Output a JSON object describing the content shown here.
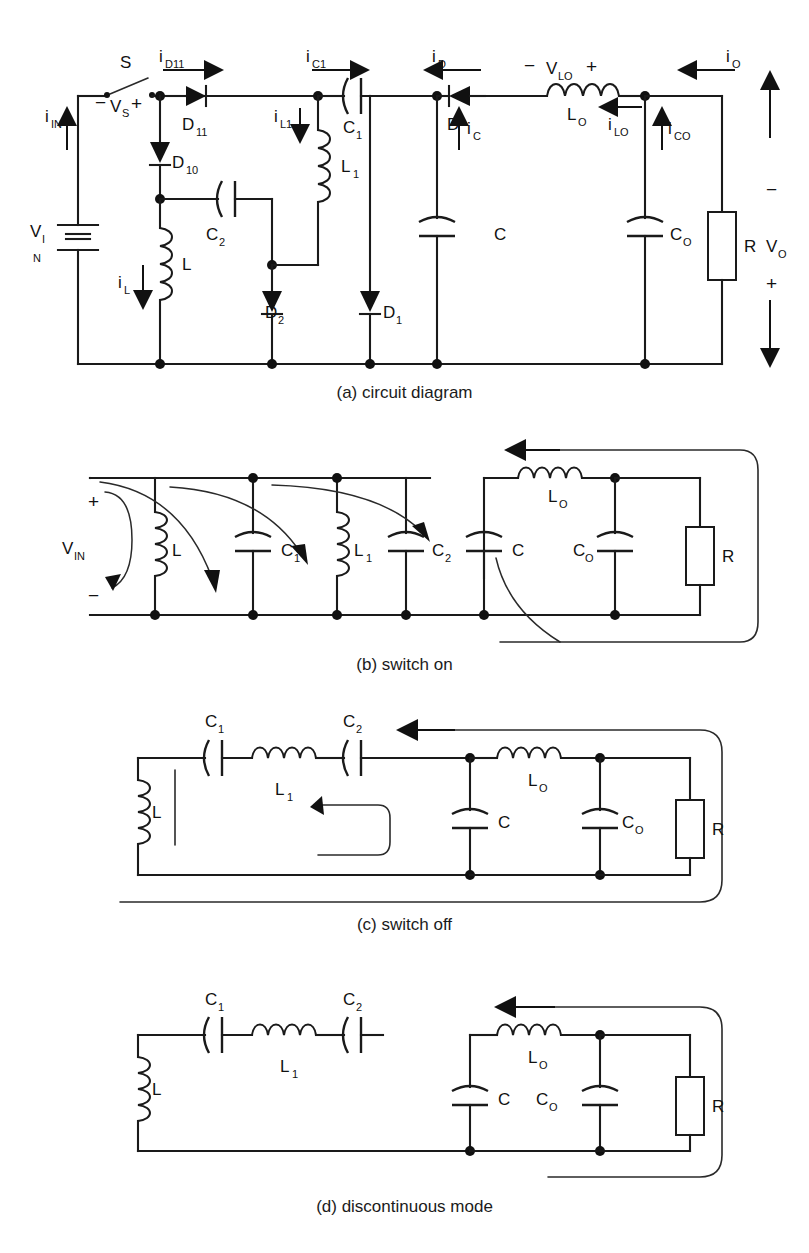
{
  "figure": {
    "panels": [
      {
        "id": "a",
        "caption": "(a) circuit diagram",
        "components": [
          {
            "name": "S",
            "type": "switch"
          },
          {
            "name": "V S",
            "type": "voltage-label"
          },
          {
            "name": "V IN",
            "type": "source"
          },
          {
            "name": "D 11",
            "type": "diode"
          },
          {
            "name": "D 10",
            "type": "diode"
          },
          {
            "name": "D 2",
            "type": "diode"
          },
          {
            "name": "D 1",
            "type": "diode"
          },
          {
            "name": "D",
            "type": "diode"
          },
          {
            "name": "L",
            "type": "inductor"
          },
          {
            "name": "L 1",
            "type": "inductor"
          },
          {
            "name": "L O",
            "type": "inductor"
          },
          {
            "name": "C 1",
            "type": "capacitor"
          },
          {
            "name": "C 2",
            "type": "capacitor"
          },
          {
            "name": "C",
            "type": "capacitor"
          },
          {
            "name": "C O",
            "type": "capacitor"
          },
          {
            "name": "R",
            "type": "resistor"
          },
          {
            "name": "V O",
            "type": "output-voltage"
          }
        ],
        "currents": [
          "i IN",
          "i D11",
          "i C1",
          "i D",
          "i O",
          "i L1",
          "i L",
          "i C",
          "i LO",
          "i CO"
        ],
        "voltages": [
          "V S",
          "V LO",
          "V IN",
          "V O"
        ],
        "labels": {
          "switch": "S",
          "vs": "V",
          "vs_sub": "S",
          "vin_main": "V",
          "vin_sub1": "I",
          "vin_sub2": "N",
          "i_in": "i",
          "i_in_sub": "IN",
          "i_d11": "i",
          "i_d11_sub": "D11",
          "d11": "D",
          "d11_sub": "11",
          "d10": "D",
          "d10_sub": "10",
          "d2": "D",
          "d2_sub": "2",
          "d1": "D",
          "d1_sub": "1",
          "d": "D",
          "i_l": "i",
          "i_l_sub": "L",
          "l": "L",
          "c2": "C",
          "c2_sub": "2",
          "i_l1": "i",
          "i_l1_sub": "L1",
          "l1": "L",
          "l1_sub": "1",
          "i_c1": "i",
          "i_c1_sub": "C1",
          "c1": "C",
          "c1_sub": "1",
          "i_d": "i",
          "i_d_sub": "D",
          "i_c": "i",
          "i_c_sub": "C",
          "v_lo": "V",
          "v_lo_sub": "LO",
          "lo": "L",
          "lo_sub": "O",
          "i_lo": "i",
          "i_lo_sub": "LO",
          "i_co": "i",
          "i_co_sub": "CO",
          "c": "C",
          "co": "C",
          "co_sub": "O",
          "r": "R",
          "vo": "V",
          "vo_sub": "O",
          "i_o": "i",
          "i_o_sub": "O",
          "plus": "+",
          "minus": "−"
        }
      },
      {
        "id": "b",
        "caption": "(b) switch on",
        "components": [
          {
            "name": "V IN",
            "type": "source"
          },
          {
            "name": "L",
            "type": "inductor"
          },
          {
            "name": "C 1",
            "type": "capacitor"
          },
          {
            "name": "L 1",
            "type": "inductor"
          },
          {
            "name": "C 2",
            "type": "capacitor"
          },
          {
            "name": "C",
            "type": "capacitor"
          },
          {
            "name": "L O",
            "type": "inductor"
          },
          {
            "name": "C O",
            "type": "capacitor"
          },
          {
            "name": "R",
            "type": "resistor"
          }
        ],
        "labels": {
          "vin": "V",
          "vin_sub": "IN",
          "l": "L",
          "c1": "C",
          "c1_sub": "1",
          "l1": "L",
          "l1_sub": "1",
          "c2": "C",
          "c2_sub": "2",
          "c": "C",
          "lo": "L",
          "lo_sub": "O",
          "co": "C",
          "co_sub": "O",
          "r": "R",
          "plus": "+",
          "minus": "−"
        }
      },
      {
        "id": "c",
        "caption": "(c) switch off",
        "components": [
          {
            "name": "L",
            "type": "inductor"
          },
          {
            "name": "C 1",
            "type": "capacitor"
          },
          {
            "name": "L 1",
            "type": "inductor"
          },
          {
            "name": "C 2",
            "type": "capacitor"
          },
          {
            "name": "C",
            "type": "capacitor"
          },
          {
            "name": "L O",
            "type": "inductor"
          },
          {
            "name": "C O",
            "type": "capacitor"
          },
          {
            "name": "R",
            "type": "resistor"
          }
        ],
        "labels": {
          "l": "L",
          "c1": "C",
          "c1_sub": "1",
          "l1": "L",
          "l1_sub": "1",
          "c2": "C",
          "c2_sub": "2",
          "c": "C",
          "lo": "L",
          "lo_sub": "O",
          "co": "C",
          "co_sub": "O",
          "r": "R"
        }
      },
      {
        "id": "d",
        "caption": "(d) discontinuous mode",
        "components": [
          {
            "name": "L",
            "type": "inductor"
          },
          {
            "name": "C 1",
            "type": "capacitor"
          },
          {
            "name": "L 1",
            "type": "inductor"
          },
          {
            "name": "C 2",
            "type": "capacitor"
          },
          {
            "name": "C",
            "type": "capacitor"
          },
          {
            "name": "L O",
            "type": "inductor"
          },
          {
            "name": "C O",
            "type": "capacitor"
          },
          {
            "name": "R",
            "type": "resistor"
          }
        ],
        "labels": {
          "l": "L",
          "c1": "C",
          "c1_sub": "1",
          "l1": "L",
          "l1_sub": "1",
          "c2": "C",
          "c2_sub": "2",
          "c": "C",
          "lo": "L",
          "lo_sub": "O",
          "co": "C",
          "co_sub": "O",
          "r": "R"
        }
      }
    ]
  },
  "colors": {
    "ink": "#1a1a1a",
    "background": "#ffffff"
  }
}
